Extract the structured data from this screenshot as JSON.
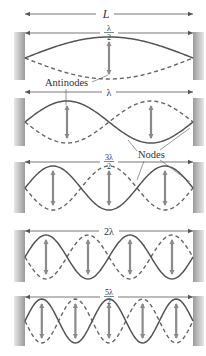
{
  "figure": {
    "length_label": "L",
    "colors": {
      "wave_solid": "#555555",
      "wave_dashed": "#666666",
      "arrow": "#8a8a8a",
      "dimension_line": "#555555",
      "wall_dark": "#9a9a9a",
      "wall_light": "#e6e6e6",
      "text": "#333333"
    },
    "callouts": {
      "antinodes": "Antinodes",
      "nodes": "Nodes"
    },
    "modes": [
      {
        "n": 1,
        "label_num": "λ",
        "label_den": "2",
        "label_inline": "",
        "label_type": "fraction",
        "panel_top": 32,
        "panel_bottom": 80,
        "center_y": 58,
        "amplitude": 21,
        "dim_y": 33
      },
      {
        "n": 2,
        "label_num": "",
        "label_den": "",
        "label_inline": "λ",
        "label_type": "inline",
        "panel_top": 98,
        "panel_bottom": 146,
        "center_y": 122,
        "amplitude": 21,
        "dim_y": 92
      },
      {
        "n": 3,
        "label_num": "3λ",
        "label_den": "2",
        "label_inline": "",
        "label_type": "fraction",
        "panel_top": 162,
        "panel_bottom": 213,
        "center_y": 188,
        "amplitude": 22,
        "dim_y": 162
      },
      {
        "n": 4,
        "label_num": "",
        "label_den": "",
        "label_inline": "2λ",
        "label_type": "inline",
        "panel_top": 230,
        "panel_bottom": 282,
        "center_y": 257,
        "amplitude": 22,
        "dim_y": 231
      },
      {
        "n": 5,
        "label_num": "5λ",
        "label_den": "2",
        "label_inline": "",
        "label_type": "fraction",
        "panel_top": 296,
        "panel_bottom": 346,
        "center_y": 321,
        "amplitude": 22,
        "dim_y": 297
      }
    ]
  }
}
